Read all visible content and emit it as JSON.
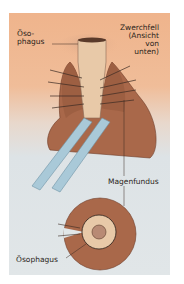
{
  "figure": {
    "labels": {
      "esophagus_top_line1": "Öso-",
      "esophagus_top_line2": "phagus",
      "diaphragm_line1": "Zwerchfell",
      "diaphragm_line2": "(Ansicht",
      "diaphragm_line3": "von",
      "diaphragm_line4": "unten)",
      "gastric_fundus": "Magenfundus",
      "esophagus_bottom": "Ösophagus"
    },
    "colors": {
      "panel_top": "#efb48c",
      "panel_bottom": "#e1e6e8",
      "stomach": "#a9684a",
      "esophagus": "#e8c9a8",
      "retractor": "#a9c9d8",
      "suture": "#3a2a22"
    }
  }
}
